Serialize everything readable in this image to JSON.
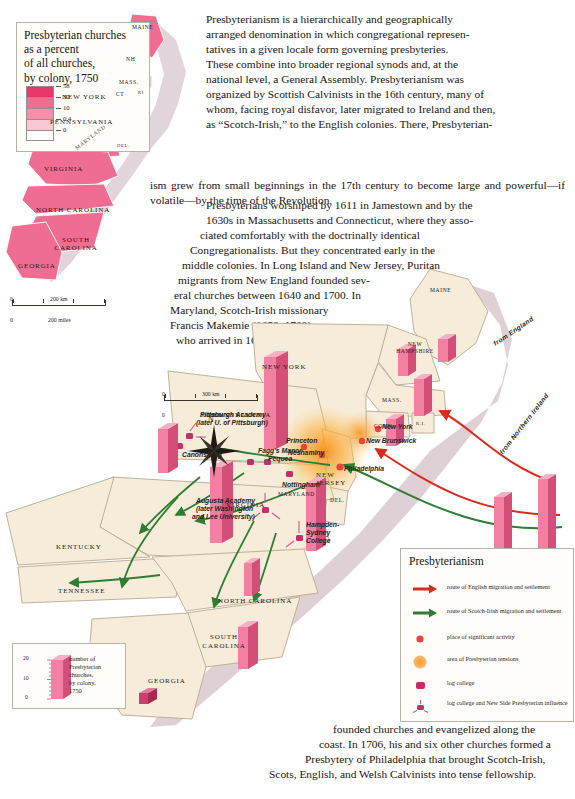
{
  "page": {
    "topic": "Presbyterianism in colonial America"
  },
  "inset_map": {
    "title_lines": [
      "Presbyterian churches",
      "as a percent",
      "of all churches,",
      "by colony, 1750"
    ],
    "legend_ticks": [
      "58",
      "30",
      "10",
      "0.4",
      "0"
    ],
    "legend_colors": [
      "#e8376b",
      "#ef6d93",
      "#f391ad",
      "#f9c6d5",
      "#ffffff"
    ],
    "scale": {
      "km": "200 km",
      "miles": "200 miles",
      "zero": "0"
    },
    "state_labels": [
      "MAINE",
      "NH",
      "NEW YORK",
      "MASS.",
      "CT",
      "RI",
      "PENNSYLVANIA",
      "NEW JERSEY",
      "DEL.",
      "MARYLAND",
      "VIRGINIA",
      "NORTH CAROLINA",
      "SOUTH CAROLINA",
      "GEORGIA"
    ]
  },
  "main_map": {
    "scale": {
      "km": "300 km",
      "miles": "300 miles",
      "zero": "0"
    },
    "compass": "N",
    "state_labels": [
      "MAINE",
      "NEW HAMPSHIRE",
      "NEW YORK",
      "MASS.",
      "CONN.",
      "R.I.",
      "PENNSYLVANIA",
      "NEW JERSEY",
      "DEL.",
      "MARYLAND",
      "VIRGINIA",
      "KENTUCKY",
      "TENNESSEE",
      "NORTH CAROLINA",
      "SOUTH CAROLINA",
      "GEORGIA"
    ],
    "place_labels": [
      "Pittsburgh Academy",
      "(later U. of Pittsburgh)",
      "Canonsburg",
      "Fagg's Manor",
      "Pequea",
      "Nottingham",
      "Princeton",
      "Neshaminy",
      "Philadelphia",
      "New Brunswick",
      "New York",
      "Augusta Academy",
      "(later Washington",
      "and Lee University)",
      "Hampden-",
      "Sydney",
      "College"
    ],
    "route_labels": [
      "from England",
      "from Northern Ireland"
    ],
    "bar_callouts": [
      "DEL.",
      "NEW",
      "JERSEY"
    ]
  },
  "legend": {
    "title": "Presbyterianism",
    "items": [
      {
        "icon": "red-arrow-icon",
        "label": "route of English migration and settlement"
      },
      {
        "icon": "green-arrow-icon",
        "label": "route of Scotch-Irish migration and settlement"
      },
      {
        "icon": "red-dot-icon",
        "label": "place of significant activity"
      },
      {
        "icon": "orange-glow-icon",
        "label": "area of Presbyterian tensions"
      },
      {
        "icon": "log-college-icon",
        "label": "log college"
      },
      {
        "icon": "new-side-icon",
        "label": "log college and New Side Presbyterian influence"
      }
    ]
  },
  "bar_legend": {
    "axis": [
      "20",
      "10",
      "0"
    ],
    "caption_lines": [
      "number of",
      "Presbyterian",
      "churches,",
      "by colony,",
      "1750"
    ]
  },
  "prose": {
    "paragraph_1": [
      "Presbyterianism is a hierarchically and geographically",
      "arranged denomination in which congregational represen-",
      "tatives in a given locale form governing presbyteries.",
      "These combine into broader regional synods and, at the",
      "national level, a General Assembly. Presbyterianism was",
      "organized by Scottish Calvinists in the 16th century, many of",
      "whom, facing royal disfavor, later migrated to Ireland and then,",
      "as “Scotch-Irish,” to the English colonies. There, Presbyterian-",
      "ism grew from small beginnings in the 17th century to become large and",
      "powerful—if volatile—by the time of the Revolution."
    ],
    "paragraph_2": [
      "Presbyterians worshiped by 1611 in Jamestown and by the",
      "1630s in Massachusetts and Connecticut, where they asso-",
      "ciated comfortably with the doctrinally identical",
      "Congregationalists. But they concentrated early in the",
      "middle colonies. In Long Island and New Jersey, Puritan",
      "migrants from New England founded sev-",
      "eral churches between 1640 and 1700. In",
      "Maryland, Scotch-Irish missionary",
      "Francis Makemie (1658–1708),",
      "who arrived in 1683,"
    ],
    "paragraph_3": [
      "founded churches and evangelized along the",
      "coast. In 1706, his and six other churches formed a",
      "Presbytery of Philadelphia that brought Scotch-Irish,",
      "Scots, English, and Welsh Calvinists into tense fellowship."
    ]
  },
  "colors": {
    "land": "#f6ecd9",
    "land_stroke": "#b9a98f",
    "pink_fill": "#ef6d93",
    "pink_dark": "#d7426d",
    "bar_face": "#f37fa3",
    "bar_side": "#d34f79",
    "bar_top": "#f9aec4",
    "coast_shadow": "#c9b0bb",
    "red_route": "#d92b1c",
    "green_route": "#2e7d32",
    "orange_glow": "#f79a1e"
  }
}
